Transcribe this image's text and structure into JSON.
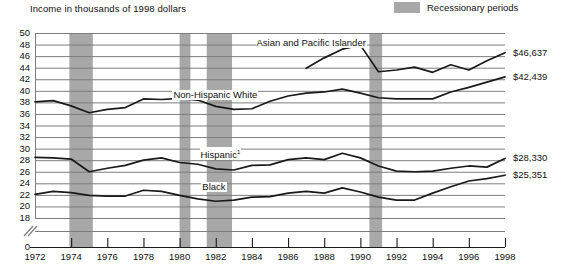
{
  "axis_title": "Income in thousands of 1998 dollars",
  "legend": {
    "swatch_name": "recession-swatch",
    "label": "Recessionary periods",
    "color": "#a8a8a8"
  },
  "colors": {
    "line": "#1a1a1a",
    "grid": "#7d7d7d",
    "recession_band": "#a8a8a8",
    "background": "#ffffff"
  },
  "chart_data": {
    "type": "line",
    "title": "Income in thousands of 1998 dollars",
    "xlabel": "",
    "ylabel": "Income in thousands of 1998 dollars",
    "xlim": [
      1972,
      1998
    ],
    "ylim": [
      18,
      50
    ],
    "ytick_step": 2,
    "grid": true,
    "axis_break": true,
    "axis_break_symbol": "//",
    "legend_position": "top-right",
    "yticks": [
      50,
      48,
      46,
      44,
      42,
      40,
      38,
      36,
      34,
      32,
      30,
      28,
      26,
      24,
      22,
      20,
      18,
      0
    ],
    "ytick_labels": [
      "50",
      "48",
      "46",
      "44",
      "42",
      "40",
      "38",
      "36",
      "34",
      "32",
      "30",
      "28",
      "26",
      "24",
      "22",
      "20",
      "18",
      "0"
    ],
    "xticks": [
      1972,
      1974,
      1976,
      1978,
      1980,
      1982,
      1984,
      1986,
      1988,
      1990,
      1992,
      1994,
      1996,
      1998
    ],
    "xtick_labels": [
      "1972",
      "1974",
      "1976",
      "1978",
      "1980",
      "1982",
      "1984",
      "1986",
      "1988",
      "1990",
      "1992",
      "1994",
      "1996",
      "1998"
    ],
    "recessions": [
      {
        "start": 1973.9,
        "end": 1975.2
      },
      {
        "start": 1980.0,
        "end": 1980.6
      },
      {
        "start": 1981.5,
        "end": 1982.9
      },
      {
        "start": 1990.5,
        "end": 1991.2
      }
    ],
    "series": [
      {
        "name": "Asian and Pacific Islander",
        "label": "Asian and Pacific Islander",
        "label_x": 1984.2,
        "label_y": 48.3,
        "end_label": "$46,637",
        "x": [
          1987,
          1988,
          1989,
          1990,
          1991,
          1992,
          1993,
          1994,
          1995,
          1996,
          1997,
          1998
        ],
        "y": [
          43.9,
          45.7,
          47.2,
          47.9,
          43.3,
          43.6,
          44.1,
          43.2,
          44.5,
          43.6,
          45.2,
          46.6
        ]
      },
      {
        "name": "Non-Hispanic White",
        "label": "Non-Hispanic White",
        "label_x": 1979.6,
        "label_y": 39.2,
        "end_label": "$42,439",
        "x": [
          1972,
          1973,
          1974,
          1975,
          1976,
          1977,
          1978,
          1979,
          1980,
          1981,
          1982,
          1983,
          1984,
          1985,
          1986,
          1987,
          1988,
          1989,
          1990,
          1991,
          1992,
          1993,
          1994,
          1995,
          1996,
          1997,
          1998
        ],
        "y": [
          38.1,
          38.3,
          37.4,
          36.2,
          36.8,
          37.1,
          38.6,
          38.5,
          38.7,
          38.4,
          37.3,
          36.8,
          36.9,
          38.2,
          39.1,
          39.6,
          39.8,
          40.3,
          39.6,
          38.8,
          38.6,
          38.6,
          38.6,
          39.8,
          40.6,
          41.5,
          42.4
        ]
      },
      {
        "name": "Hispanic",
        "label": "Hispanic",
        "label_footnote": "1",
        "label_x": 1981.1,
        "label_y": 29.4,
        "end_label": "$28,330",
        "x": [
          1972,
          1973,
          1974,
          1975,
          1976,
          1977,
          1978,
          1979,
          1980,
          1981,
          1982,
          1983,
          1984,
          1985,
          1986,
          1987,
          1988,
          1989,
          1990,
          1991,
          1992,
          1993,
          1994,
          1995,
          1996,
          1997,
          1998
        ],
        "y": [
          28.5,
          28.4,
          28.2,
          26.0,
          26.6,
          27.1,
          28.0,
          28.4,
          27.6,
          27.3,
          26.5,
          26.3,
          27.1,
          27.2,
          28.1,
          28.4,
          28.1,
          29.2,
          28.4,
          27.0,
          26.1,
          26.0,
          26.1,
          26.6,
          27.0,
          26.8,
          28.3
        ]
      },
      {
        "name": "Black",
        "label": "Black",
        "label_x": 1981.2,
        "label_y": 23.3,
        "end_label": "$25,351",
        "x": [
          1972,
          1973,
          1974,
          1975,
          1976,
          1977,
          1978,
          1979,
          1980,
          1981,
          1982,
          1983,
          1984,
          1985,
          1986,
          1987,
          1988,
          1989,
          1990,
          1991,
          1992,
          1993,
          1994,
          1995,
          1996,
          1997,
          1998
        ],
        "y": [
          22.1,
          22.6,
          22.4,
          21.9,
          21.8,
          21.8,
          22.8,
          22.6,
          21.9,
          21.3,
          20.9,
          21.1,
          21.6,
          21.7,
          22.3,
          22.6,
          22.3,
          23.2,
          22.5,
          21.6,
          21.1,
          21.1,
          22.3,
          23.4,
          24.4,
          24.8,
          25.4
        ]
      }
    ]
  }
}
